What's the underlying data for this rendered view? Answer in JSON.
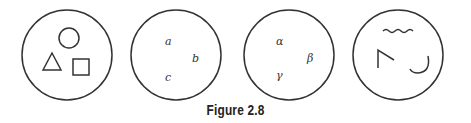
{
  "figure": {
    "caption": "Figure 2.8",
    "panels": [
      {
        "id": 1,
        "content": "shapes",
        "items": [
          "circle",
          "triangle",
          "square"
        ]
      },
      {
        "id": 2,
        "content": "latin-letters",
        "labels": [
          "a",
          "b",
          "c"
        ]
      },
      {
        "id": 3,
        "content": "greek-letters",
        "labels": [
          "α",
          "β",
          "γ"
        ]
      },
      {
        "id": 4,
        "content": "abstract-marks",
        "items": [
          "wavy-line",
          "angle",
          "hook"
        ]
      }
    ]
  }
}
